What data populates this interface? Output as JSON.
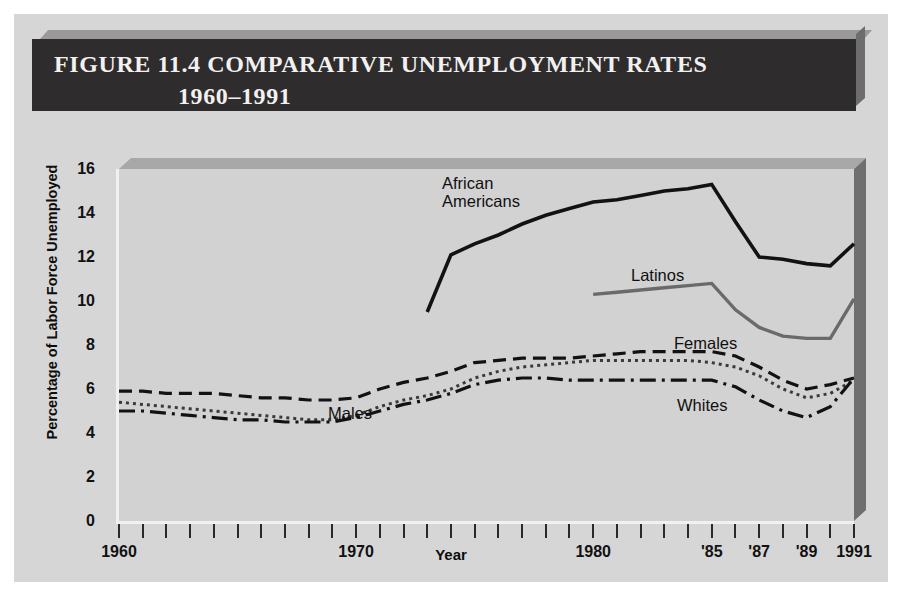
{
  "figure": {
    "title_line_1": "FIGURE 11.4  COMPARATIVE UNEMPLOYMENT RATES",
    "title_line_2": "1960–1991",
    "title_bar_color": "#2e2c2d",
    "title_text_color": "#f2f1ef",
    "panel_background": "#d6d6d6",
    "plot_background": "#d2d2d2",
    "axis_color": "#2a2a2a"
  },
  "chart_data": {
    "type": "line",
    "title": "FIGURE 11.4  COMPARATIVE UNEMPLOYMENT RATES 1960–1991",
    "subtitle": "1960–1991",
    "xlabel": "Year",
    "ylabel": "Percentage of Labor Force Unemployed",
    "xlim": [
      1960,
      1991
    ],
    "ylim": [
      0,
      16
    ],
    "grid": false,
    "legend_position": "inline-annotations",
    "y_ticks": [
      0,
      2,
      4,
      6,
      8,
      10,
      12,
      14,
      16
    ],
    "y_tick_labels": [
      "0",
      "2",
      "4",
      "6",
      "8",
      "10",
      "12",
      "14",
      "16"
    ],
    "x_tick_years": [
      1960,
      1961,
      1962,
      1963,
      1964,
      1965,
      1966,
      1967,
      1968,
      1969,
      1970,
      1971,
      1972,
      1973,
      1974,
      1975,
      1976,
      1977,
      1978,
      1979,
      1980,
      1981,
      1982,
      1983,
      1984,
      1985,
      1986,
      1987,
      1988,
      1989,
      1990,
      1991
    ],
    "x_tick_labels": [
      {
        "year": 1960,
        "label": "1960"
      },
      {
        "year": 1970,
        "label": "1970"
      },
      {
        "year": 1980,
        "label": "1980"
      },
      {
        "year": 1985,
        "label": "'85"
      },
      {
        "year": 1987,
        "label": "'87"
      },
      {
        "year": 1989,
        "label": "'89"
      },
      {
        "year": 1991,
        "label": "1991"
      }
    ],
    "series": [
      {
        "name": "African Americans",
        "style": "solid",
        "color": "#121212",
        "width": 3.6,
        "x": [
          1973,
          1974,
          1975,
          1976,
          1977,
          1978,
          1979,
          1980,
          1981,
          1982,
          1983,
          1984,
          1985,
          1986,
          1987,
          1988,
          1989,
          1990,
          1991
        ],
        "y": [
          9.5,
          12.1,
          12.6,
          13.0,
          13.5,
          13.9,
          14.2,
          14.5,
          14.6,
          14.8,
          15.0,
          15.1,
          15.3,
          13.6,
          12.0,
          11.9,
          11.7,
          11.6,
          12.6
        ]
      },
      {
        "name": "Latinos",
        "style": "solid",
        "color": "#6a6a6a",
        "width": 3.4,
        "x": [
          1980,
          1981,
          1982,
          1983,
          1984,
          1985,
          1986,
          1987,
          1988,
          1989,
          1990,
          1991
        ],
        "y": [
          10.3,
          10.4,
          10.5,
          10.6,
          10.7,
          10.8,
          9.6,
          8.8,
          8.4,
          8.3,
          8.3,
          10.1
        ]
      },
      {
        "name": "Females",
        "style": "dashed",
        "color": "#121212",
        "width": 3.2,
        "x": [
          1960,
          1961,
          1962,
          1963,
          1964,
          1965,
          1966,
          1967,
          1968,
          1969,
          1970,
          1971,
          1972,
          1973,
          1974,
          1975,
          1976,
          1977,
          1978,
          1979,
          1980,
          1981,
          1982,
          1983,
          1984,
          1985,
          1986,
          1987,
          1988,
          1989,
          1990,
          1991
        ],
        "y": [
          5.9,
          5.9,
          5.8,
          5.8,
          5.8,
          5.7,
          5.6,
          5.6,
          5.5,
          5.5,
          5.6,
          6.0,
          6.3,
          6.5,
          6.8,
          7.2,
          7.3,
          7.4,
          7.4,
          7.4,
          7.5,
          7.6,
          7.7,
          7.7,
          7.7,
          7.7,
          7.5,
          7.0,
          6.4,
          6.0,
          6.2,
          6.5
        ]
      },
      {
        "name": "Males",
        "style": "dotted",
        "color": "#3a3a3a",
        "width": 3.0,
        "x": [
          1960,
          1961,
          1962,
          1963,
          1964,
          1965,
          1966,
          1967,
          1968,
          1969,
          1970,
          1971,
          1972,
          1973,
          1974,
          1975,
          1976,
          1977,
          1978,
          1979,
          1980,
          1981,
          1982,
          1983,
          1984,
          1985,
          1986,
          1987,
          1988,
          1989,
          1990,
          1991
        ],
        "y": [
          5.4,
          5.3,
          5.2,
          5.1,
          5.0,
          4.9,
          4.8,
          4.7,
          4.6,
          4.6,
          4.8,
          5.2,
          5.5,
          5.7,
          6.0,
          6.5,
          6.8,
          7.0,
          7.1,
          7.2,
          7.3,
          7.3,
          7.3,
          7.3,
          7.3,
          7.2,
          7.0,
          6.6,
          6.0,
          5.6,
          5.8,
          6.4
        ]
      },
      {
        "name": "Whites",
        "style": "dashdot",
        "color": "#121212",
        "width": 3.2,
        "x": [
          1960,
          1961,
          1962,
          1963,
          1964,
          1965,
          1966,
          1967,
          1968,
          1969,
          1970,
          1971,
          1972,
          1973,
          1974,
          1975,
          1976,
          1977,
          1978,
          1979,
          1980,
          1981,
          1982,
          1983,
          1984,
          1985,
          1986,
          1987,
          1988,
          1989,
          1990,
          1991
        ],
        "y": [
          5.0,
          5.0,
          4.9,
          4.8,
          4.7,
          4.6,
          4.6,
          4.5,
          4.5,
          4.5,
          4.7,
          5.0,
          5.3,
          5.5,
          5.8,
          6.2,
          6.4,
          6.5,
          6.5,
          6.4,
          6.4,
          6.4,
          6.4,
          6.4,
          6.4,
          6.4,
          6.1,
          5.5,
          5.0,
          4.7,
          5.2,
          6.5
        ]
      }
    ],
    "annotations": [
      {
        "text": "African Americans",
        "x_px": 428,
        "y_px": 56,
        "lines": [
          "African",
          "Americans"
        ]
      },
      {
        "text": "Latinos",
        "x_px": 617,
        "y_px": 148
      },
      {
        "text": "Females",
        "x_px": 660,
        "y_px": 216
      },
      {
        "text": "Whites",
        "x_px": 663,
        "y_px": 278
      },
      {
        "text": "Males",
        "x_px": 314,
        "y_px": 286
      }
    ]
  }
}
